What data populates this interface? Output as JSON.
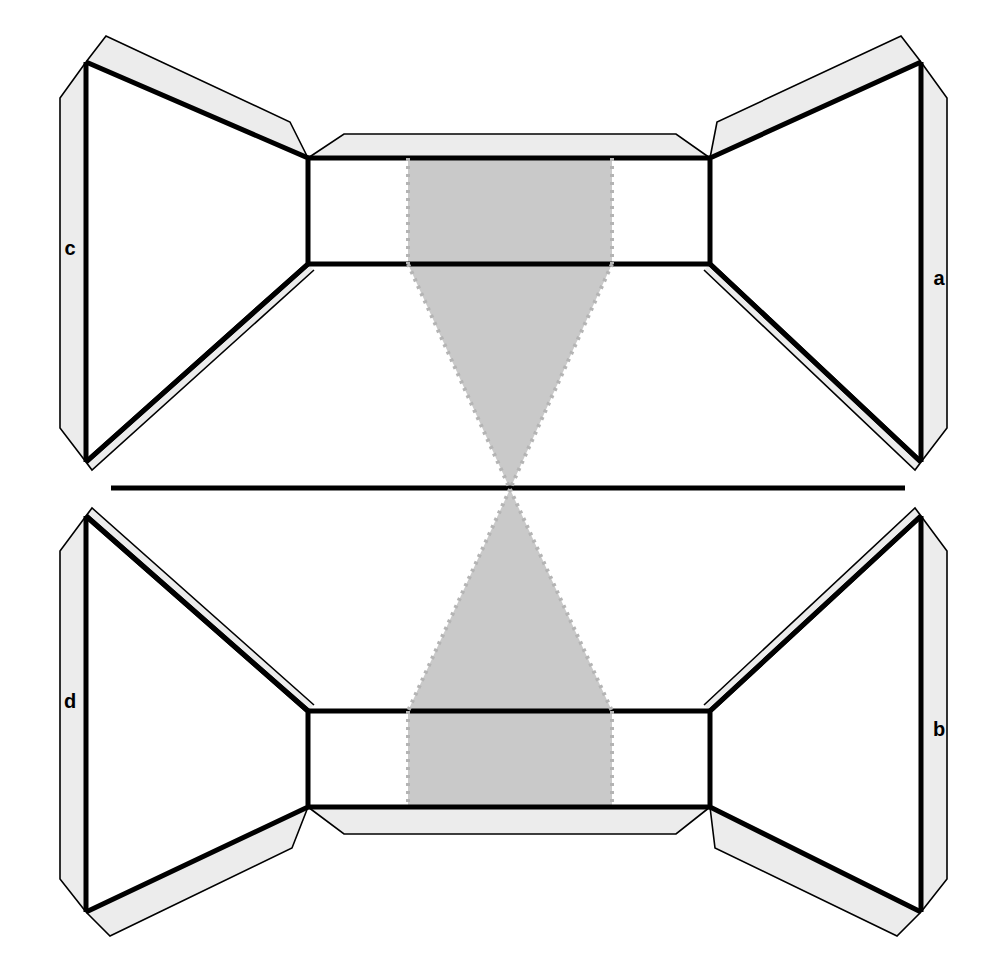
{
  "diagram": {
    "background_color": "#ffffff",
    "stroke_color": "#000000",
    "tab_fill_color": "#ececec",
    "shade_fill_color": "#c9c9c9",
    "dotted_color": "#b4b4b4",
    "face_fill_color": "#ffffff"
  },
  "labels": [
    {
      "id": "label-c",
      "text": "c",
      "x": 70,
      "y": 250,
      "edge": "left-upper-tab"
    },
    {
      "id": "label-a",
      "text": "a",
      "x": 939,
      "y": 280,
      "edge": "right-upper-tab"
    },
    {
      "id": "label-d",
      "text": "d",
      "x": 70,
      "y": 703,
      "edge": "left-lower-tab"
    },
    {
      "id": "label-b",
      "text": "b",
      "x": 939,
      "y": 731,
      "edge": "right-lower-tab"
    }
  ],
  "geometry": {
    "canvas": {
      "width": 1007,
      "height": 959
    },
    "center_axis": {
      "x": 503.5,
      "y": 489
    },
    "pinch_point": {
      "x": 510,
      "y": 489
    },
    "upper_rect": {
      "left": 308,
      "right": 710,
      "top": 158,
      "bottom": 264
    },
    "lower_rect": {
      "left": 308,
      "right": 710,
      "top": 711,
      "bottom": 807
    },
    "shade_band": {
      "left": 408,
      "right": 612
    },
    "outer_left_x": 86,
    "outer_right_x": 921,
    "upper_outer_top_y": 62,
    "upper_outer_bottom_y": 462,
    "lower_outer_top_y": 516,
    "lower_outer_bottom_y": 912,
    "mid_line": {
      "x1": 111,
      "x2": 905,
      "y": 488
    }
  },
  "shapes": {
    "upper_center_panel": "rectangle spanning the middle top band",
    "lower_center_panel": "rectangle spanning the middle bottom band",
    "upper_shade": "rectangle plus downward triangle meeting the pinch point",
    "lower_shade": "rectangle plus upward triangle meeting the pinch point",
    "left_upper_face": "trapezoid from left edge to upper rect left side",
    "right_upper_face": "trapezoid from right edge to upper rect right side",
    "left_lower_face": "trapezoid from left edge to lower rect left side",
    "right_lower_face": "trapezoid from right edge to lower rect right side"
  }
}
